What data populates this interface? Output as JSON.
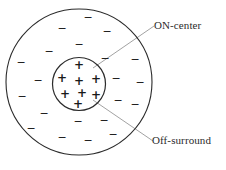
{
  "figure": {
    "background": "#ffffff",
    "stroke_color": "#2b2b2b",
    "sign_color": "#1a1a1a",
    "leader_color": "#8a8a8a"
  },
  "labels": {
    "on_center": "ON-center",
    "off_surround": "Off-surround"
  },
  "outer_circle": {
    "name": "off-surround-region",
    "cx": 79,
    "cy": 82,
    "r": 73,
    "stroke_width": 1.1
  },
  "inner_circle": {
    "name": "on-center-region",
    "cx": 79,
    "cy": 84,
    "r": 26.5,
    "stroke_width": 1.2
  },
  "leaders": [
    {
      "name": "on-center-leader",
      "x1": 93,
      "y1": 68,
      "x2": 154,
      "y2": 26
    },
    {
      "name": "off-surround-leader",
      "x1": 93,
      "y1": 100,
      "x2": 153,
      "y2": 141
    }
  ],
  "plus_signs": [
    {
      "x": 79,
      "y": 65
    },
    {
      "x": 62,
      "y": 78
    },
    {
      "x": 79,
      "y": 81
    },
    {
      "x": 96,
      "y": 79
    },
    {
      "x": 65,
      "y": 94
    },
    {
      "x": 82,
      "y": 93
    },
    {
      "x": 96,
      "y": 95
    },
    {
      "x": 78,
      "y": 104
    }
  ],
  "minus_signs": [
    {
      "x": 88,
      "y": 17
    },
    {
      "x": 62,
      "y": 28
    },
    {
      "x": 107,
      "y": 31
    },
    {
      "x": 79,
      "y": 44
    },
    {
      "x": 49,
      "y": 51
    },
    {
      "x": 21,
      "y": 62
    },
    {
      "x": 105,
      "y": 58
    },
    {
      "x": 135,
      "y": 59
    },
    {
      "x": 38,
      "y": 80
    },
    {
      "x": 116,
      "y": 78
    },
    {
      "x": 22,
      "y": 96
    },
    {
      "x": 140,
      "y": 82
    },
    {
      "x": 118,
      "y": 100
    },
    {
      "x": 44,
      "y": 113
    },
    {
      "x": 135,
      "y": 104
    },
    {
      "x": 78,
      "y": 121
    },
    {
      "x": 104,
      "y": 120
    },
    {
      "x": 31,
      "y": 128
    },
    {
      "x": 62,
      "y": 137
    },
    {
      "x": 88,
      "y": 140
    },
    {
      "x": 113,
      "y": 134
    }
  ],
  "sign_glyphs": {
    "plus": "+",
    "minus": "−"
  }
}
